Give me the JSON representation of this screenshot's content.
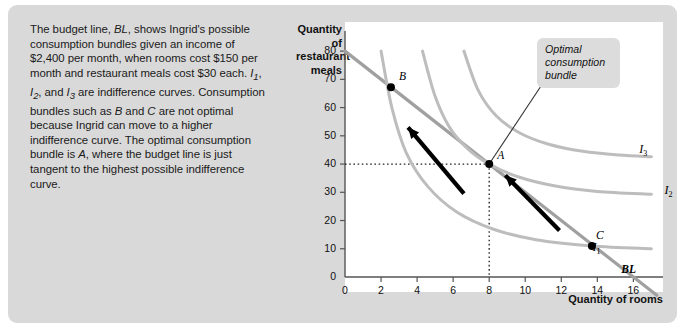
{
  "caption": {
    "text_runs": [
      {
        "t": "The budget line, ",
        "i": false
      },
      {
        "t": "BL",
        "i": true
      },
      {
        "t": ", shows Ingrid's possible consumption bundles given an income of $2,400 per month, when rooms cost $150 per month and restaurant meals cost $30 each. ",
        "i": false
      },
      {
        "t": "I",
        "i": true
      },
      {
        "t": "1",
        "i": true,
        "sub": true
      },
      {
        "t": ", ",
        "i": false
      },
      {
        "t": "I",
        "i": true
      },
      {
        "t": "2",
        "i": true,
        "sub": true
      },
      {
        "t": ", and ",
        "i": false
      },
      {
        "t": "I",
        "i": true
      },
      {
        "t": "3",
        "i": true,
        "sub": true
      },
      {
        "t": " are indifference curves. Consumption bundles such as ",
        "i": false
      },
      {
        "t": "B",
        "i": true
      },
      {
        "t": " and ",
        "i": false
      },
      {
        "t": "C",
        "i": true
      },
      {
        "t": " are not optimal because Ingrid can move to a higher indifference curve. The optimal consumption bundle is ",
        "i": false
      },
      {
        "t": "A",
        "i": true
      },
      {
        "t": ", where the budget line is just tangent to the highest possible indifference curve.",
        "i": false
      }
    ]
  },
  "callout": {
    "line1": "Optimal",
    "line2": "consumption",
    "line3": "bundle"
  },
  "chart_data": {
    "type": "line",
    "title": "",
    "xlabel": "Quantity of rooms",
    "ylabel": "Quantity of restaurant meals",
    "xlim": [
      0,
      17.2
    ],
    "ylim": [
      0,
      85
    ],
    "xticks": [
      0,
      2,
      4,
      6,
      8,
      10,
      12,
      14,
      16
    ],
    "yticks": [
      0,
      10,
      20,
      30,
      40,
      50,
      60,
      70,
      80
    ],
    "grid": false,
    "legend_position": "inline-right",
    "series": [
      {
        "name": "BL",
        "label": "BL",
        "type": "budget-line",
        "color": "#a0a0a0",
        "points": [
          [
            0,
            80
          ],
          [
            16,
            0
          ]
        ],
        "note": "Income $2,400; rooms $150; meals $30"
      },
      {
        "name": "I1",
        "label": "I1",
        "type": "indifference-curve",
        "color": "#bdbdbd",
        "points": [
          [
            2.0,
            80
          ],
          [
            2.6,
            60
          ],
          [
            3.4,
            44
          ],
          [
            4.6,
            32
          ],
          [
            6.2,
            23
          ],
          [
            8.2,
            17
          ],
          [
            10.6,
            13.2
          ],
          [
            13.7,
            11.0
          ],
          [
            17.0,
            10.0
          ]
        ]
      },
      {
        "name": "I2",
        "label": "I2",
        "type": "indifference-curve",
        "color": "#bdbdbd",
        "points": [
          [
            4.3,
            80
          ],
          [
            5.0,
            64
          ],
          [
            5.8,
            53
          ],
          [
            6.8,
            45.5
          ],
          [
            8.0,
            40.0
          ],
          [
            9.6,
            35.5
          ],
          [
            11.6,
            32.3
          ],
          [
            14.0,
            30.3
          ],
          [
            17.0,
            29.3
          ]
        ]
      },
      {
        "name": "I3",
        "label": "I3",
        "type": "indifference-curve",
        "color": "#bdbdbd",
        "points": [
          [
            6.6,
            80
          ],
          [
            7.4,
            66
          ],
          [
            8.4,
            57
          ],
          [
            9.7,
            51
          ],
          [
            11.3,
            47
          ],
          [
            13.2,
            44.5
          ],
          [
            15.2,
            43.2
          ],
          [
            17.0,
            42.6
          ]
        ]
      }
    ],
    "points": [
      {
        "label": "A",
        "x": 8,
        "y": 40,
        "role": "optimal-consumption-bundle",
        "guides": "dotted"
      },
      {
        "label": "B",
        "x": 2.55,
        "y": 67.2,
        "role": "not-optimal"
      },
      {
        "label": "C",
        "x": 13.7,
        "y": 11.0,
        "role": "not-optimal"
      }
    ],
    "arrows": [
      {
        "from": [
          6.6,
          29.5
        ],
        "to": [
          3.5,
          53.0
        ],
        "note": "move from B toward A",
        "color": "#000000"
      },
      {
        "from": [
          11.9,
          16.5
        ],
        "to": [
          8.9,
          36.0
        ],
        "note": "move from C toward A",
        "color": "#000000"
      }
    ],
    "annotations": [
      {
        "text": "Optimal consumption bundle",
        "target_point": "A"
      }
    ]
  }
}
